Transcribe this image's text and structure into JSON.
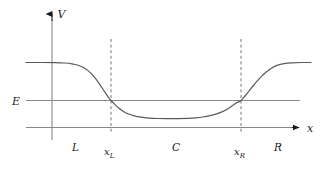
{
  "figure": {
    "background_color": "#ffffff",
    "curve_color": "#555555",
    "line_color": "#808080",
    "dash_color": "#808080",
    "text_color": "#1a1a1a"
  },
  "axes": {
    "y_axis_label": "V",
    "x_axis_label": "x",
    "energy_label": "E"
  },
  "regions": [
    {
      "label": "L",
      "name": "left-region"
    },
    {
      "label": "C",
      "name": "center-region"
    },
    {
      "label": "R",
      "name": "right-region"
    }
  ],
  "boundaries": [
    {
      "base": "x",
      "sub": "L",
      "name": "x-left-boundary"
    },
    {
      "base": "x",
      "sub": "R",
      "name": "x-right-boundary"
    }
  ],
  "chart_data": {
    "type": "line",
    "title": "",
    "xlabel": "x",
    "ylabel": "V",
    "grid": false,
    "legend": "none",
    "xlim": [
      0,
      323
    ],
    "ylim": [
      171,
      0
    ],
    "annotations": {
      "energy_level_y": 100.5,
      "baseline_y": 127.5,
      "plateau_y": 62.5,
      "well_bottom_y": 118.5,
      "x_left_boundary": 111,
      "x_right_boundary": 241,
      "y_axis_x": 52
    },
    "series": [
      {
        "name": "V(x)",
        "points": [
          [
            26,
            62.5
          ],
          [
            40,
            62.5
          ],
          [
            55,
            62.6
          ],
          [
            65,
            63.0
          ],
          [
            72,
            63.8
          ],
          [
            78,
            65.2
          ],
          [
            83,
            67.2
          ],
          [
            88,
            70.6
          ],
          [
            92,
            74.4
          ],
          [
            96,
            79.2
          ],
          [
            100,
            84.8
          ],
          [
            104,
            90.8
          ],
          [
            108,
            96.6
          ],
          [
            111,
            100.5
          ],
          [
            115,
            104.6
          ],
          [
            119,
            108.2
          ],
          [
            123,
            111.2
          ],
          [
            128,
            113.8
          ],
          [
            134,
            115.8
          ],
          [
            141,
            117.2
          ],
          [
            149,
            118.1
          ],
          [
            158,
            118.5
          ],
          [
            168,
            118.6
          ],
          [
            178,
            118.6
          ],
          [
            188,
            118.4
          ],
          [
            196,
            117.9
          ],
          [
            203,
            117.0
          ],
          [
            210,
            115.7
          ],
          [
            216,
            114.1
          ],
          [
            222,
            111.9
          ],
          [
            228,
            108.7
          ],
          [
            233,
            105.3
          ],
          [
            237,
            102.6
          ],
          [
            241,
            100.5
          ],
          [
            245,
            96.0
          ],
          [
            249,
            91.0
          ],
          [
            253,
            86.0
          ],
          [
            257,
            81.2
          ],
          [
            261,
            76.8
          ],
          [
            266,
            72.2
          ],
          [
            271,
            68.4
          ],
          [
            277,
            65.4
          ],
          [
            284,
            63.6
          ],
          [
            292,
            62.8
          ],
          [
            301,
            62.5
          ],
          [
            311,
            62.5
          ]
        ]
      },
      {
        "name": "E",
        "points": [
          [
            26,
            100.5
          ],
          [
            300,
            100.5
          ]
        ]
      },
      {
        "name": "baseline",
        "points": [
          [
            26,
            127.5
          ],
          [
            300,
            127.5
          ]
        ]
      }
    ]
  }
}
